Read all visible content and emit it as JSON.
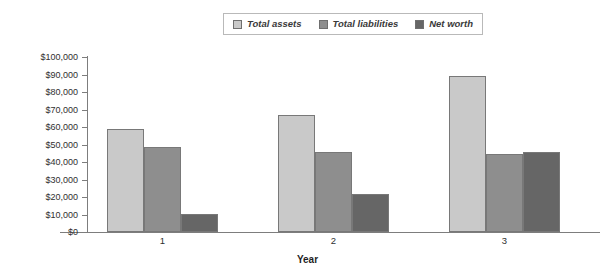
{
  "chart_data": {
    "type": "bar",
    "title": "",
    "xlabel": "Year",
    "ylabel": "",
    "categories": [
      "1",
      "2",
      "3"
    ],
    "series": [
      {
        "name": "Total assets",
        "color": "#c9c9c9",
        "values": [
          59000,
          67000,
          89000
        ]
      },
      {
        "name": "Total liabilities",
        "color": "#8e8e8e",
        "values": [
          48500,
          46000,
          44500
        ]
      },
      {
        "name": "Net worth",
        "color": "#666666",
        "values": [
          10300,
          21700,
          45700
        ]
      }
    ],
    "ylim": [
      0,
      100000
    ],
    "ytick_values": [
      0,
      10000,
      20000,
      30000,
      40000,
      50000,
      60000,
      70000,
      80000,
      90000,
      100000
    ],
    "ytick_labels": [
      "$0",
      "$10,000",
      "$20,000",
      "$30,000",
      "$40,000",
      "$50,000",
      "$60,000",
      "$70,000",
      "$80,000",
      "$90,000",
      "$100,000"
    ],
    "xtick_labels": [
      "1",
      "2",
      "3"
    ],
    "grid": false,
    "legend_position": "top-center"
  },
  "legend": {
    "items": [
      {
        "label": "Total assets",
        "swatch": "#c9c9c9"
      },
      {
        "label": "Total liabilities",
        "swatch": "#8e8e8e"
      },
      {
        "label": "Net worth",
        "swatch": "#666666"
      }
    ]
  },
  "axes": {
    "x_title": "Year"
  }
}
